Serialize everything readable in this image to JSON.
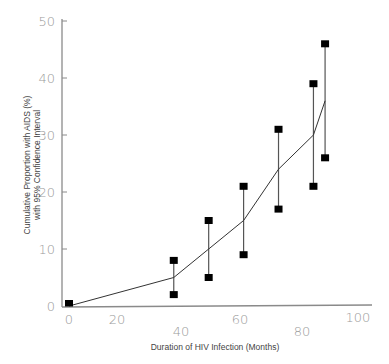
{
  "chart_data": {
    "type": "line",
    "title": "",
    "xlabel": "Duration of HIV Infection (Months)",
    "ylabel_line1": "Cumulative Proportion with AIDS (%)",
    "ylabel_line2": "with 95% Confidence Interval",
    "xlim": [
      0,
      100
    ],
    "ylim": [
      0,
      50
    ],
    "x_ticks": [
      "0",
      "20",
      "40",
      "60",
      "80",
      "100"
    ],
    "y_ticks": [
      "0",
      "10",
      "20",
      "30",
      "40",
      "50"
    ],
    "grid": false,
    "legend": "none",
    "series": [
      {
        "name": "Cumulative proportion with AIDS",
        "x": [
          0,
          36,
          48,
          60,
          72,
          84,
          88
        ],
        "values": [
          0,
          5,
          10,
          15,
          24,
          30,
          36
        ]
      }
    ],
    "confidence_intervals": [
      {
        "x": 0,
        "lower": 0,
        "upper": 0
      },
      {
        "x": 36,
        "lower": 2,
        "upper": 8
      },
      {
        "x": 48,
        "lower": 5,
        "upper": 15
      },
      {
        "x": 60,
        "lower": 9,
        "upper": 21
      },
      {
        "x": 72,
        "lower": 17,
        "upper": 31
      },
      {
        "x": 84,
        "lower": 21,
        "upper": 39
      },
      {
        "x": 88,
        "lower": 26,
        "upper": 46
      }
    ]
  },
  "colors": {
    "axis": "#8a8a8a",
    "line": "#333333",
    "marker": "#000000",
    "tick_label": "#9a9a9a"
  }
}
